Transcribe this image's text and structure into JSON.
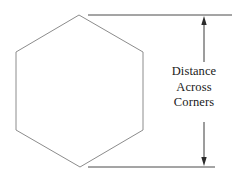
{
  "figure": {
    "background_color": "#ffffff",
    "shape": {
      "name": "hexagon",
      "orientation": "point-up",
      "stroke_color": "#8c8c8c",
      "stroke_width": 1,
      "fill": "none",
      "vertices": [
        {
          "x": 79,
          "y": 15
        },
        {
          "x": 143,
          "y": 52
        },
        {
          "x": 143,
          "y": 130
        },
        {
          "x": 80,
          "y": 167
        },
        {
          "x": 16,
          "y": 130
        },
        {
          "x": 16,
          "y": 52
        }
      ]
    },
    "dimension": {
      "stroke_color": "#3a3a3a",
      "measure_axis": "vertical",
      "from_y": 15,
      "to_y": 167,
      "line_x": 204,
      "extension_lines": [
        {
          "name": "top-extension-line",
          "x1": 88,
          "y1": 15,
          "x2": 232,
          "y2": 15
        },
        {
          "name": "bottom-extension-line",
          "x1": 88,
          "y1": 167,
          "x2": 215,
          "y2": 167
        }
      ],
      "arrows": [
        {
          "name": "top-arrow",
          "points": "up",
          "tip_x": 204,
          "tip_y": 17
        },
        {
          "name": "bottom-arrow",
          "points": "down",
          "tip_x": 204,
          "tip_y": 165
        }
      ]
    },
    "label": {
      "lines": [
        "Distance",
        "Across",
        "Corners"
      ],
      "text_color": "#1a1a1a",
      "align": "center"
    }
  }
}
